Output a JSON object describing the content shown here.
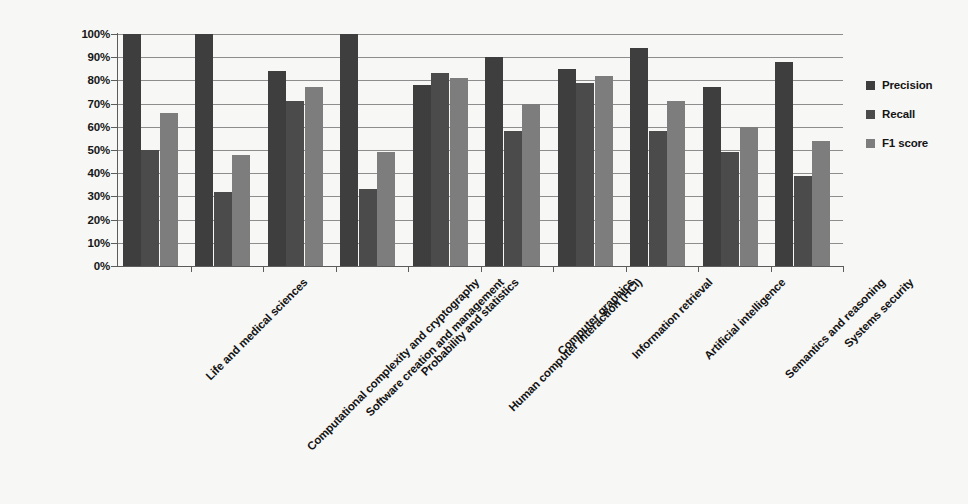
{
  "chart_data": {
    "type": "bar",
    "title": "",
    "xlabel": "",
    "ylabel": "",
    "ylim": [
      0,
      100
    ],
    "y_tick_labels": [
      "100%",
      "90%",
      "80%",
      "70%",
      "60%",
      "50%",
      "40%",
      "30%",
      "20%",
      "10%",
      "0%"
    ],
    "y_tick_values": [
      100,
      90,
      80,
      70,
      60,
      50,
      40,
      30,
      20,
      10,
      0
    ],
    "grid": true,
    "legend_position": "right",
    "categories": [
      "Life and medical sciences",
      "Computational complexity and cryptography",
      "Software creation and management",
      "Probability and statistics",
      "Human computer interaction (HCI)",
      "Computer graphics",
      "Information retrieval",
      "Artificial intelligence",
      "Semantics and reasoning",
      "Systems security"
    ],
    "series": [
      {
        "name": "Precision",
        "color": "#3e3e3e",
        "values": [
          100,
          100,
          84,
          100,
          78,
          90,
          85,
          94,
          77,
          88
        ]
      },
      {
        "name": "Recall",
        "color": "#4b4b4b",
        "values": [
          50,
          32,
          71,
          33,
          83,
          58,
          79,
          58,
          49,
          39
        ]
      },
      {
        "name": "F1 score",
        "color": "#7d7d7d",
        "values": [
          66,
          48,
          77,
          49,
          81,
          70,
          82,
          71,
          60,
          54
        ]
      }
    ]
  },
  "legend": {
    "items": [
      {
        "label": "Precision",
        "key": "precision"
      },
      {
        "label": "Recall",
        "key": "recall"
      },
      {
        "label": "F1 score",
        "key": "f1"
      }
    ]
  }
}
